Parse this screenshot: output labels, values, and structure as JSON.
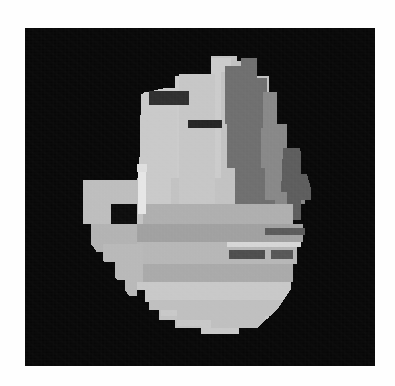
{
  "page": {
    "background_color": "#fefefe",
    "width": 395,
    "height": 386,
    "caption": ""
  },
  "image_frame": {
    "label": "grayscale-scan-canvas",
    "background_color": "#070707",
    "x": 25,
    "y": 28,
    "width": 350,
    "height": 338
  },
  "palette": {
    "background": "#070707",
    "near_black_detail": "#2b2b2b",
    "dark_gray": "#4a4a4a",
    "mid_dark_gray": "#6a6a6a",
    "mid_gray": "#8a8a8a",
    "mid_light_gray": "#a3a3a3",
    "light_gray": "#bcbcbc",
    "lighter_gray": "#cdcdcd",
    "brightest": "#e2e2e2"
  },
  "regions": [
    {
      "name": "main-body-light",
      "tone_label": "light_gray",
      "color": "#c2c2c2",
      "description": "large central quantized body of the scanned object"
    },
    {
      "name": "upper-left-panel",
      "tone_label": "lighter_gray",
      "color": "#cbcbcb",
      "description": "bright upper-left slab with dark inset patch"
    },
    {
      "name": "upper-right-column",
      "tone_label": "mid_dark_gray",
      "color": "#6e6e6e",
      "description": "darker vertical band on the right flank"
    },
    {
      "name": "right-flank-mid",
      "tone_label": "mid_gray",
      "color": "#878787",
      "description": "stepped medium-gray blocks on the right edge"
    },
    {
      "name": "mid-horizontal-band",
      "tone_label": "mid_light_gray",
      "color": "#a0a0a0",
      "description": "wide horizontal mid-tone stripe across the middle"
    },
    {
      "name": "lower-body-band",
      "tone_label": "light_gray",
      "color": "#b6b6b6",
      "description": "lower horizontal banded area"
    },
    {
      "name": "bottom-lobe",
      "tone_label": "lighter_gray",
      "color": "#c8c8c8",
      "description": "rounded bright lobe at the bottom of the object"
    },
    {
      "name": "left-ledge",
      "tone_label": "light_gray",
      "color": "#bdbdbd",
      "description": "narrow shelf projecting to the left at mid height"
    },
    {
      "name": "dark-inset-top",
      "tone_label": "near_black_detail",
      "color": "#2e2e2e",
      "description": "dark rectangular inset near the top-left of the body"
    },
    {
      "name": "dark-inset-bar",
      "tone_label": "near_black_detail",
      "color": "#242424",
      "description": "thin dark horizontal bar below the top inset"
    },
    {
      "name": "dark-stripe-right",
      "tone_label": "dark_gray",
      "color": "#4d4d4d",
      "description": "short dark stripe on the lower right of the body"
    },
    {
      "name": "bright-highlight-edge",
      "tone_label": "brightest",
      "color": "#e6e6e6",
      "description": "bright vertical highlight along the left-center margin"
    },
    {
      "name": "detached-fragment-right",
      "tone_label": "light_gray",
      "color": "#b9b9b9",
      "description": "small isolated bright speck far right of the object"
    },
    {
      "name": "detached-sliver-left",
      "tone_label": "mid_light_gray",
      "color": "#a8a8a8",
      "description": "small isolated bright sliver on the left edge"
    }
  ],
  "annotations": {
    "alt_text": "Quantized grayscale segmentation of an irregular object on a black field",
    "object_bbox_label": "object-bounding-box"
  }
}
